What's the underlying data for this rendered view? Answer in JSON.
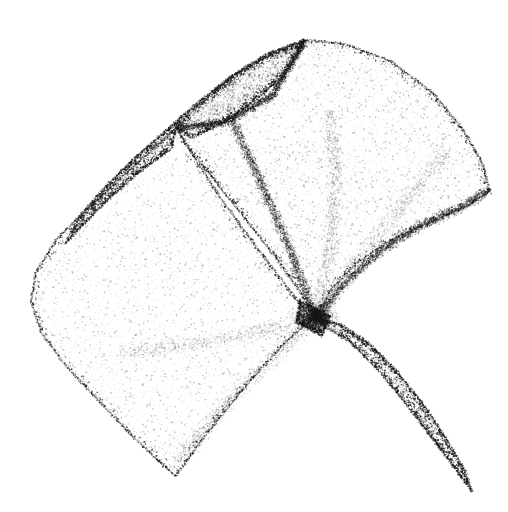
{
  "figure": {
    "title": "Stippled folded parametric surface",
    "description": "Pointillist (stippled) monochrome rendering of a smooth folded surface with a cusp self-intersection, a dark narrow fold lobe at upper left and a dark leaf-shaped tail extending to the lower right.",
    "width": 508,
    "height": 512,
    "background_color": "#ffffff",
    "dot_color": "#1a1a1a",
    "render_style": "stipple",
    "total_dots": 150000
  },
  "palette": {
    "background": "#ffffff",
    "ink": "#1a1a1a",
    "edge_ink": "#000000",
    "light_region": "#f2f2f2",
    "dark_region": "#555555"
  },
  "chart_data": {
    "type": "scatter",
    "title": "Stippled folded parametric surface",
    "xlabel": "",
    "ylabel": "",
    "xlim": [
      0,
      508
    ],
    "ylim": [
      0,
      512
    ],
    "grid": false,
    "legend": "none",
    "regions": [
      {
        "name": "main-sheet",
        "label": "Large light upper sheet",
        "fill_density": 0.3,
        "outline": [
          [
            305,
            40
          ],
          [
            345,
            44
          ],
          [
            392,
            62
          ],
          [
            432,
            92
          ],
          [
            462,
            128
          ],
          [
            482,
            162
          ],
          [
            490,
            190
          ],
          [
            468,
            206
          ],
          [
            430,
            222
          ],
          [
            392,
            240
          ],
          [
            358,
            262
          ],
          [
            332,
            288
          ],
          [
            316,
            318
          ],
          [
            300,
            292
          ],
          [
            276,
            258
          ],
          [
            246,
            220
          ],
          [
            216,
            182
          ],
          [
            190,
            150
          ],
          [
            176,
            128
          ],
          [
            200,
            104
          ],
          [
            232,
            76
          ],
          [
            266,
            54
          ],
          [
            305,
            40
          ]
        ]
      },
      {
        "name": "left-sheet",
        "label": "Large light left/lower sheet",
        "fill_density": 0.26,
        "outline": [
          [
            176,
            128
          ],
          [
            150,
            152
          ],
          [
            118,
            180
          ],
          [
            86,
            210
          ],
          [
            56,
            240
          ],
          [
            36,
            272
          ],
          [
            31,
            302
          ],
          [
            42,
            334
          ],
          [
            66,
            366
          ],
          [
            98,
            400
          ],
          [
            134,
            438
          ],
          [
            168,
            470
          ],
          [
            176,
            476
          ],
          [
            196,
            448
          ],
          [
            224,
            412
          ],
          [
            256,
            374
          ],
          [
            288,
            340
          ],
          [
            312,
            320
          ],
          [
            288,
            288
          ],
          [
            256,
            246
          ],
          [
            222,
            200
          ],
          [
            196,
            160
          ],
          [
            176,
            128
          ]
        ]
      },
      {
        "name": "upper-fold-lobe",
        "label": "Dark narrow fold lobe, upper left",
        "fill_density": 0.62,
        "outline": [
          [
            305,
            40
          ],
          [
            268,
            54
          ],
          [
            232,
            76
          ],
          [
            198,
            102
          ],
          [
            166,
            130
          ],
          [
            132,
            160
          ],
          [
            102,
            190
          ],
          [
            78,
            218
          ],
          [
            65,
            244
          ],
          [
            84,
            224
          ],
          [
            110,
            198
          ],
          [
            140,
            172
          ],
          [
            172,
            148
          ],
          [
            176,
            128
          ],
          [
            192,
            138
          ],
          [
            222,
            124
          ],
          [
            256,
            100
          ],
          [
            286,
            74
          ],
          [
            305,
            40
          ]
        ]
      },
      {
        "name": "tail-lobe",
        "label": "Dark leaf-shaped tail, lower right",
        "fill_density": 0.58,
        "outline": [
          [
            316,
            318
          ],
          [
            340,
            324
          ],
          [
            368,
            342
          ],
          [
            396,
            370
          ],
          [
            422,
            402
          ],
          [
            446,
            438
          ],
          [
            466,
            472
          ],
          [
            472,
            492
          ],
          [
            456,
            470
          ],
          [
            432,
            438
          ],
          [
            406,
            404
          ],
          [
            378,
            370
          ],
          [
            350,
            342
          ],
          [
            324,
            326
          ],
          [
            316,
            318
          ]
        ]
      },
      {
        "name": "cusp-point",
        "label": "Self-intersection cusp",
        "fill_density": 0.95,
        "outline": [
          [
            300,
            300
          ],
          [
            330,
            316
          ],
          [
            322,
            336
          ],
          [
            296,
            322
          ],
          [
            300,
            300
          ]
        ]
      }
    ],
    "creases": [
      {
        "name": "central-crease",
        "points": [
          [
            232,
            120
          ],
          [
            260,
            180
          ],
          [
            286,
            240
          ],
          [
            306,
            292
          ],
          [
            316,
            318
          ]
        ],
        "darkness": 0.55
      },
      {
        "name": "upper-fold-crease",
        "points": [
          [
            176,
            128
          ],
          [
            226,
            122
          ],
          [
            272,
            96
          ],
          [
            305,
            40
          ]
        ],
        "darkness": 0.7
      },
      {
        "name": "right-inner-edge",
        "points": [
          [
            316,
            318
          ],
          [
            342,
            286
          ],
          [
            376,
            254
          ],
          [
            416,
            228
          ],
          [
            460,
            208
          ],
          [
            490,
            190
          ]
        ],
        "darkness": 0.6
      },
      {
        "name": "radial-crease-a",
        "points": [
          [
            316,
            318
          ],
          [
            330,
            250
          ],
          [
            336,
            180
          ],
          [
            330,
            110
          ]
        ],
        "darkness": 0.18
      },
      {
        "name": "radial-crease-b",
        "points": [
          [
            316,
            318
          ],
          [
            358,
            260
          ],
          [
            404,
            204
          ],
          [
            446,
            152
          ]
        ],
        "darkness": 0.15
      },
      {
        "name": "radial-crease-c",
        "points": [
          [
            316,
            318
          ],
          [
            268,
            330
          ],
          [
            200,
            344
          ],
          [
            120,
            352
          ]
        ],
        "darkness": 0.14
      },
      {
        "name": "radial-crease-d",
        "points": [
          [
            316,
            318
          ],
          [
            272,
            360
          ],
          [
            222,
            408
          ],
          [
            178,
            462
          ]
        ],
        "darkness": 0.16
      }
    ],
    "anchors": [
      {
        "name": "top-apex",
        "x": 320,
        "y": 40
      },
      {
        "name": "right-tip",
        "x": 490,
        "y": 190
      },
      {
        "name": "left-extreme",
        "x": 31,
        "y": 300
      },
      {
        "name": "bottom-left-corner",
        "x": 176,
        "y": 476
      },
      {
        "name": "tail-tip",
        "x": 472,
        "y": 492
      },
      {
        "name": "cusp",
        "x": 316,
        "y": 318
      },
      {
        "name": "fold-lobe-tip",
        "x": 65,
        "y": 245
      }
    ]
  }
}
